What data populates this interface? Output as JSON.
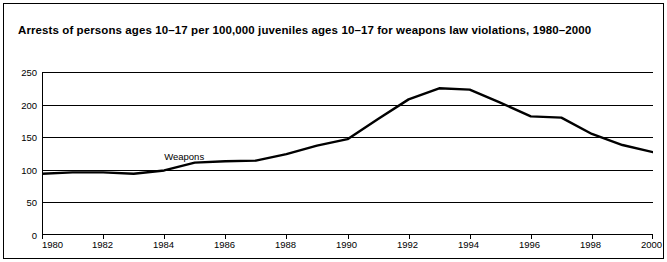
{
  "title": "Arrests of persons ages 10–17 per 100,000 juveniles ages 10–17 for weapons law violations, 1980–2000",
  "chart_data": {
    "type": "line",
    "title": "Arrests of persons ages 10–17 per 100,000 juveniles ages 10–17 for weapons law violations, 1980–2000",
    "xlabel": "",
    "ylabel": "",
    "xlim": [
      1980,
      2000
    ],
    "ylim": [
      0,
      250
    ],
    "grid": true,
    "legend_position": "inline-label",
    "y_ticks": [
      0,
      50,
      100,
      150,
      200,
      250
    ],
    "x_ticks": [
      1980,
      1982,
      1984,
      1986,
      1988,
      1990,
      1992,
      1994,
      1996,
      1998,
      2000
    ],
    "x_tick_labels": [
      "1980",
      "1982",
      "1984",
      "1986",
      "1988",
      "1990",
      "1992",
      "1994",
      "1996",
      "1998",
      "2000"
    ],
    "y_tick_labels": [
      "0",
      "50",
      "100",
      "150",
      "200",
      "250"
    ],
    "line_color": "#000000",
    "series": [
      {
        "name": "Weapons",
        "x": [
          1980,
          1981,
          1982,
          1983,
          1984,
          1985,
          1986,
          1987,
          1988,
          1989,
          1990,
          1991,
          1992,
          1993,
          1994,
          1995,
          1996,
          1997,
          1998,
          1999,
          2000
        ],
        "values": [
          94,
          96,
          96,
          94,
          99,
          111,
          113,
          114,
          124,
          137,
          147,
          178,
          208,
          225,
          223,
          203,
          182,
          180,
          155,
          138,
          127
        ]
      }
    ],
    "annotations": [
      {
        "text": "Weapons",
        "x": 1984.0,
        "y": 118
      }
    ]
  }
}
